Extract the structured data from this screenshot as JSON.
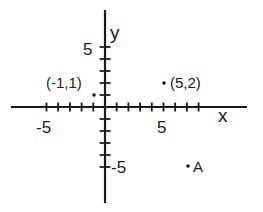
{
  "diagram": {
    "type": "coordinate-plane",
    "colors": {
      "ink": "#1a1a1a",
      "background": "#ffffff"
    },
    "axes": {
      "x_label": "x",
      "y_label": "y",
      "x_tick_min": -5,
      "x_tick_max": 8,
      "y_tick_min": -5,
      "y_tick_max": 5,
      "labeled_ticks": {
        "x_neg": "-5",
        "x_pos": "5",
        "y_pos": "5",
        "y_neg": "-5"
      }
    },
    "points": [
      {
        "name": "point-neg1-1",
        "x": -1,
        "y": 1,
        "label": "(-1,1)"
      },
      {
        "name": "point-5-2",
        "x": 5,
        "y": 2,
        "label": "(5,2)"
      },
      {
        "name": "point-A",
        "x": 7,
        "y": -5,
        "label": "A"
      }
    ]
  }
}
